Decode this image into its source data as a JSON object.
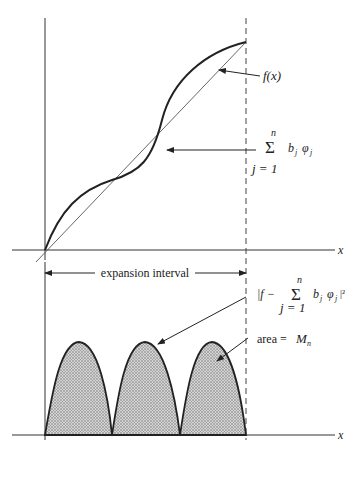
{
  "figure": {
    "top_plot": {
      "x_axis_label": "x",
      "function_label": "f(x)",
      "sum_label": {
        "sigma": "Σ",
        "upper": "n",
        "lower": "j = 1",
        "term": "b_j φ_j",
        "term_b": "b",
        "term_phi": "φ",
        "sub": "j"
      }
    },
    "interval": {
      "label": "expansion interval"
    },
    "bottom_plot": {
      "x_axis_label": "x",
      "error_label": {
        "prefix": "|f −",
        "sigma": "Σ",
        "upper": "n",
        "lower": "j = 1",
        "term_b": "b",
        "term_phi": "φ",
        "sub": "j",
        "suffix": "|²"
      },
      "area_label": "area = ",
      "area_symbol": "M",
      "area_sub": "n",
      "lobes": 3
    },
    "colors": {
      "ink": "#222222",
      "thin_line": "#555555",
      "fill": "#b8b8b8"
    }
  }
}
